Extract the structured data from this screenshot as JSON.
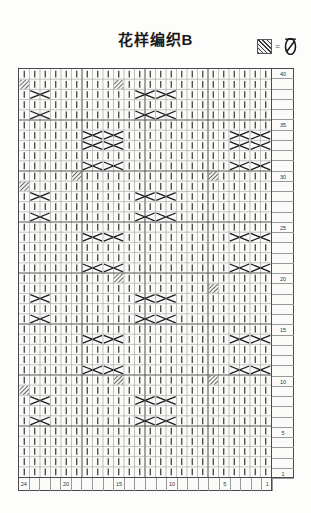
{
  "title": "花样编织B",
  "legend": {
    "swatch_name": "hatched-cell-swatch",
    "equals": "=",
    "symbol_name": "twisted-stitch-symbol"
  },
  "chart_data": {
    "type": "heatmap",
    "title": "花样编织B",
    "xlabel": "",
    "ylabel": "",
    "columns": 24,
    "rows": 40,
    "grid": true,
    "legend_position": "top-right",
    "col_tick_labels": [
      "24",
      "20",
      "15",
      "10",
      "5",
      "1"
    ],
    "col_tick_positions": [
      24,
      20,
      15,
      10,
      5,
      1
    ],
    "row_tick_labels": [
      "40",
      "35",
      "30",
      "25",
      "20",
      "15",
      "10",
      "5",
      "1"
    ],
    "row_tick_positions": [
      40,
      35,
      30,
      25,
      20,
      15,
      10,
      5,
      1
    ],
    "cell_kinds": {
      "knit": "vertical bar (knit stitch)",
      "cross": "2-wide cable cross (X)",
      "hatch": "hatched twisted stitch",
      "plain": "empty cell"
    },
    "crosses": [
      {
        "row": 38,
        "col": 10
      },
      {
        "row": 38,
        "col": 12
      },
      {
        "row": 38,
        "col": 22
      },
      {
        "row": 36,
        "col": 10
      },
      {
        "row": 36,
        "col": 12
      },
      {
        "row": 36,
        "col": 22
      },
      {
        "row": 34,
        "col": 1
      },
      {
        "row": 34,
        "col": 3
      },
      {
        "row": 34,
        "col": 15
      },
      {
        "row": 34,
        "col": 17
      },
      {
        "row": 33,
        "col": 1
      },
      {
        "row": 33,
        "col": 3
      },
      {
        "row": 33,
        "col": 15
      },
      {
        "row": 33,
        "col": 17
      },
      {
        "row": 31,
        "col": 1
      },
      {
        "row": 31,
        "col": 3
      },
      {
        "row": 31,
        "col": 15
      },
      {
        "row": 31,
        "col": 17
      },
      {
        "row": 28,
        "col": 10
      },
      {
        "row": 28,
        "col": 12
      },
      {
        "row": 28,
        "col": 22
      },
      {
        "row": 26,
        "col": 10
      },
      {
        "row": 26,
        "col": 12
      },
      {
        "row": 26,
        "col": 22
      },
      {
        "row": 24,
        "col": 1
      },
      {
        "row": 24,
        "col": 3
      },
      {
        "row": 24,
        "col": 15
      },
      {
        "row": 24,
        "col": 17
      },
      {
        "row": 21,
        "col": 1
      },
      {
        "row": 21,
        "col": 3
      },
      {
        "row": 21,
        "col": 15
      },
      {
        "row": 21,
        "col": 17
      },
      {
        "row": 18,
        "col": 10
      },
      {
        "row": 18,
        "col": 12
      },
      {
        "row": 18,
        "col": 22
      },
      {
        "row": 16,
        "col": 10
      },
      {
        "row": 16,
        "col": 12
      },
      {
        "row": 16,
        "col": 22
      },
      {
        "row": 14,
        "col": 1
      },
      {
        "row": 14,
        "col": 3
      },
      {
        "row": 14,
        "col": 15
      },
      {
        "row": 14,
        "col": 17
      },
      {
        "row": 11,
        "col": 1
      },
      {
        "row": 11,
        "col": 3
      },
      {
        "row": 11,
        "col": 15
      },
      {
        "row": 11,
        "col": 17
      },
      {
        "row": 8,
        "col": 10
      },
      {
        "row": 8,
        "col": 12
      },
      {
        "row": 8,
        "col": 22
      },
      {
        "row": 6,
        "col": 10
      },
      {
        "row": 6,
        "col": 12
      },
      {
        "row": 6,
        "col": 22
      }
    ],
    "hatches": [
      {
        "row": 39,
        "col": 15
      },
      {
        "row": 39,
        "col": 24
      },
      {
        "row": 30,
        "col": 6
      },
      {
        "row": 30,
        "col": 19
      },
      {
        "row": 29,
        "col": 24
      },
      {
        "row": 20,
        "col": 15
      },
      {
        "row": 19,
        "col": 6
      },
      {
        "row": 10,
        "col": 15
      },
      {
        "row": 10,
        "col": 6
      },
      {
        "row": 9,
        "col": 24
      }
    ]
  }
}
